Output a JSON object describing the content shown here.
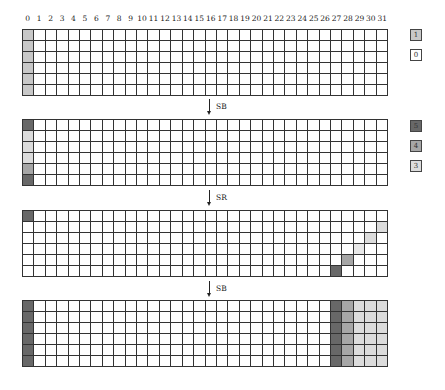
{
  "colors": {
    "0": "#ffffff",
    "1": "#c8c8c8",
    "3": "#dcdcdc",
    "3b": "#e8e8e8",
    "4": "#a6a6a6",
    "5": "#686868",
    "grid_line": "#333333"
  },
  "column_labels": [
    "0",
    "1",
    "2",
    "3",
    "4",
    "5",
    "6",
    "7",
    "8",
    "9",
    "10",
    "11",
    "12",
    "13",
    "14",
    "15",
    "16",
    "17",
    "18",
    "19",
    "20",
    "21",
    "22",
    "23",
    "24",
    "25",
    "26",
    "27",
    "28",
    "29",
    "30",
    "31"
  ],
  "legends": [
    {
      "top": 29,
      "items": [
        {
          "label": "1",
          "color_key": "1"
        },
        {
          "label": "0",
          "color_key": "0"
        }
      ]
    },
    {
      "top": 120,
      "items": [
        {
          "label": "5",
          "color_key": "5"
        },
        {
          "label": "4",
          "color_key": "4"
        },
        {
          "label": "3",
          "color_key": "3"
        }
      ]
    }
  ],
  "arrows": [
    {
      "label": "SB",
      "top": 97
    },
    {
      "label": "SR",
      "top": 188
    },
    {
      "label": "SB",
      "top": 279
    }
  ],
  "grids": [
    {
      "name": "grid-initial",
      "top": 29,
      "rows": 6,
      "cols": 32,
      "cells": [
        {
          "r": 0,
          "c": 0,
          "v": "1"
        },
        {
          "r": 1,
          "c": 0,
          "v": "1"
        },
        {
          "r": 2,
          "c": 0,
          "v": "1"
        },
        {
          "r": 3,
          "c": 0,
          "v": "1"
        },
        {
          "r": 4,
          "c": 0,
          "v": "1"
        },
        {
          "r": 5,
          "c": 0,
          "v": "1"
        }
      ]
    },
    {
      "name": "grid-after-sb",
      "top": 119,
      "rows": 6,
      "cols": 32,
      "cells": [
        {
          "r": 0,
          "c": 0,
          "v": "5"
        },
        {
          "r": 1,
          "c": 0,
          "v": "3"
        },
        {
          "r": 2,
          "c": 0,
          "v": "3"
        },
        {
          "r": 3,
          "c": 0,
          "v": "3"
        },
        {
          "r": 4,
          "c": 0,
          "v": "4"
        },
        {
          "r": 5,
          "c": 0,
          "v": "5"
        }
      ]
    },
    {
      "name": "grid-after-sr",
      "top": 210,
      "rows": 6,
      "cols": 32,
      "cells": [
        {
          "r": 0,
          "c": 0,
          "v": "5"
        },
        {
          "r": 1,
          "c": 31,
          "v": "3"
        },
        {
          "r": 2,
          "c": 30,
          "v": "3"
        },
        {
          "r": 3,
          "c": 29,
          "v": "3b"
        },
        {
          "r": 4,
          "c": 28,
          "v": "4"
        },
        {
          "r": 5,
          "c": 27,
          "v": "5"
        }
      ]
    },
    {
      "name": "grid-after-sb-2",
      "top": 300,
      "rows": 6,
      "cols": 32,
      "cells": [
        {
          "r": 0,
          "c": 0,
          "v": "5"
        },
        {
          "r": 1,
          "c": 0,
          "v": "5"
        },
        {
          "r": 2,
          "c": 0,
          "v": "5"
        },
        {
          "r": 3,
          "c": 0,
          "v": "5"
        },
        {
          "r": 4,
          "c": 0,
          "v": "5"
        },
        {
          "r": 5,
          "c": 0,
          "v": "5"
        },
        {
          "r": 0,
          "c": 27,
          "v": "5"
        },
        {
          "r": 1,
          "c": 27,
          "v": "5"
        },
        {
          "r": 2,
          "c": 27,
          "v": "5"
        },
        {
          "r": 3,
          "c": 27,
          "v": "5"
        },
        {
          "r": 4,
          "c": 27,
          "v": "5"
        },
        {
          "r": 5,
          "c": 27,
          "v": "5"
        },
        {
          "r": 0,
          "c": 28,
          "v": "4"
        },
        {
          "r": 1,
          "c": 28,
          "v": "4"
        },
        {
          "r": 2,
          "c": 28,
          "v": "4"
        },
        {
          "r": 3,
          "c": 28,
          "v": "4"
        },
        {
          "r": 4,
          "c": 28,
          "v": "4"
        },
        {
          "r": 5,
          "c": 28,
          "v": "4"
        },
        {
          "r": 0,
          "c": 29,
          "v": "3"
        },
        {
          "r": 1,
          "c": 29,
          "v": "3"
        },
        {
          "r": 2,
          "c": 29,
          "v": "3"
        },
        {
          "r": 3,
          "c": 29,
          "v": "3"
        },
        {
          "r": 4,
          "c": 29,
          "v": "3"
        },
        {
          "r": 5,
          "c": 29,
          "v": "3"
        },
        {
          "r": 0,
          "c": 30,
          "v": "3"
        },
        {
          "r": 1,
          "c": 30,
          "v": "3"
        },
        {
          "r": 2,
          "c": 30,
          "v": "3"
        },
        {
          "r": 3,
          "c": 30,
          "v": "3"
        },
        {
          "r": 4,
          "c": 30,
          "v": "3"
        },
        {
          "r": 5,
          "c": 30,
          "v": "3"
        },
        {
          "r": 0,
          "c": 31,
          "v": "3"
        },
        {
          "r": 1,
          "c": 31,
          "v": "3"
        },
        {
          "r": 2,
          "c": 31,
          "v": "3"
        },
        {
          "r": 3,
          "c": 31,
          "v": "3"
        },
        {
          "r": 4,
          "c": 31,
          "v": "3"
        },
        {
          "r": 5,
          "c": 31,
          "v": "3"
        }
      ]
    }
  ]
}
